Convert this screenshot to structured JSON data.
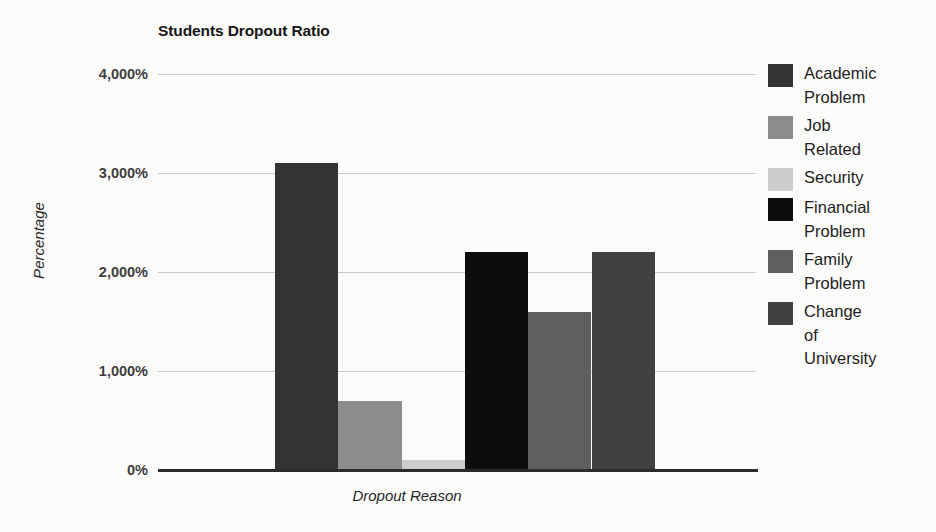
{
  "chart_data": {
    "type": "bar",
    "title": "Students Dropout Ratio",
    "xlabel": "Dropout Reason",
    "ylabel": "Percentage",
    "categories": [
      "Academic Problem",
      "Job Related",
      "Security",
      "Financial Problem",
      "Family Problem",
      "Change of University"
    ],
    "values": [
      3100,
      700,
      100,
      2200,
      1600,
      2200
    ],
    "value_labels": [
      "3,100%",
      "700%",
      "100%",
      "2,200%",
      "1,600%",
      "2,200%"
    ],
    "ylim": [
      0,
      4000
    ],
    "y_ticks": [
      0,
      1000,
      2000,
      3000,
      4000
    ],
    "y_tick_labels": [
      "0%",
      "1,000%",
      "2,000%",
      "3,000%",
      "4,000%"
    ],
    "x_tick_labels": [],
    "grid": true,
    "legend_position": "right",
    "series_colors": [
      "#333333",
      "#8c8c8c",
      "#cccccc",
      "#0d0d0d",
      "#5e5e5e",
      "#404040"
    ],
    "legend": [
      {
        "label": "Academic\nProblem",
        "color": "#333333"
      },
      {
        "label": "Job\nRelated",
        "color": "#8c8c8c"
      },
      {
        "label": "Security",
        "color": "#cccccc"
      },
      {
        "label": "Financial\nProblem",
        "color": "#0d0d0d"
      },
      {
        "label": "Family\nProblem",
        "color": "#5e5e5e"
      },
      {
        "label": "Change\nof\nUniversity",
        "color": "#404040"
      }
    ]
  },
  "style": {
    "background": "#fbfbfa",
    "gridline_color": "#c9c9c9",
    "axis_color": "#2b2b2b",
    "text_color": "#1a1a1a"
  }
}
